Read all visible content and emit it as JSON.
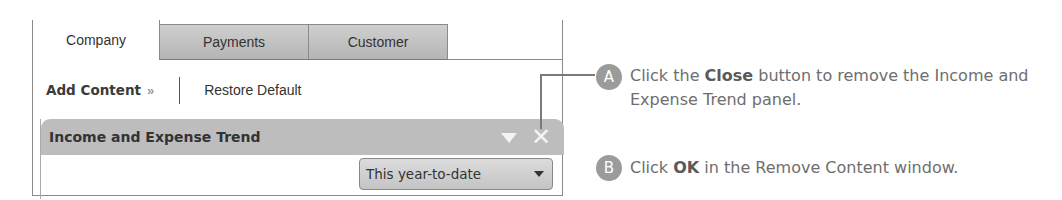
{
  "tabs": [
    {
      "label": "Company",
      "active": true
    },
    {
      "label": "Payments",
      "active": false
    },
    {
      "label": "Customer",
      "active": false
    }
  ],
  "toolbar": {
    "add_content_label": "Add Content",
    "add_content_chevron": "»",
    "restore_default_label": "Restore Default"
  },
  "panel": {
    "title": "Income and Expense Trend",
    "collapse_icon": "triangle-down-icon",
    "close_icon": "✕",
    "period_select": {
      "value": "This year-to-date"
    }
  },
  "steps": [
    {
      "badge": "A",
      "prefix": "Click the ",
      "bold": "Close",
      "suffix": " button to remove the Income and Expense Trend panel."
    },
    {
      "badge": "B",
      "prefix": "Click ",
      "bold": "OK",
      "suffix": " in the Remove Content window."
    }
  ],
  "colors": {
    "panel_header": "#bdbdbd",
    "inactive_tab": "#c4c4c4",
    "badge": "#9b9b9b",
    "step_text": "#6e6e6e"
  }
}
